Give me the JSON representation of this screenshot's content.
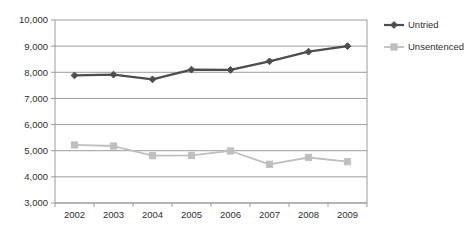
{
  "chart_data": {
    "type": "line",
    "title": "",
    "subtitle": "",
    "xlabel": "",
    "ylabel": "",
    "categories": [
      "2002",
      "2003",
      "2004",
      "2005",
      "2006",
      "2007",
      "2008",
      "2009"
    ],
    "series": [
      {
        "name": "Untried",
        "color": "#4d4d4d",
        "marker": "diamond",
        "values": [
          7880,
          7910,
          7730,
          8100,
          8090,
          8420,
          8790,
          9000
        ]
      },
      {
        "name": "Unsentenced",
        "color": "#bfbfbf",
        "marker": "square",
        "values": [
          5220,
          5180,
          4810,
          4820,
          4990,
          4480,
          4740,
          4580
        ]
      }
    ],
    "ylim": [
      3000,
      10000
    ],
    "ytick_values": [
      3000,
      4000,
      5000,
      6000,
      7000,
      8000,
      9000,
      10000
    ],
    "ytick_labels": [
      "3,000",
      "4,000",
      "5,000",
      "6,000",
      "7,000",
      "8,000",
      "9,000",
      "10,000"
    ],
    "grid": {
      "horizontal": true,
      "vertical": false,
      "color": "#9b9b9b"
    },
    "legend": {
      "position": "right",
      "entries": [
        {
          "label": "Untried",
          "color": "#4d4d4d",
          "marker": "diamond"
        },
        {
          "label": "Unsentenced",
          "color": "#bfbfbf",
          "marker": "square"
        }
      ]
    },
    "plot_area": {
      "left": 55,
      "top": 20,
      "right": 367,
      "bottom": 203
    },
    "axis_color": "#9b9b9b"
  }
}
